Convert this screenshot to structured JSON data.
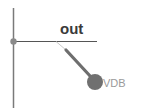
{
  "schematic": {
    "net": {
      "label": "out"
    },
    "probe": {
      "label": "VDB",
      "type": "voltage-probe"
    },
    "colors": {
      "wire": "#7a7a7a",
      "junction": "#8a8a8a",
      "probe": "#707070",
      "probe_lead": "#c8c8c8",
      "net_label": "#3a3a3a",
      "probe_label": "#9a9a9a",
      "background": "#ffffff"
    }
  }
}
